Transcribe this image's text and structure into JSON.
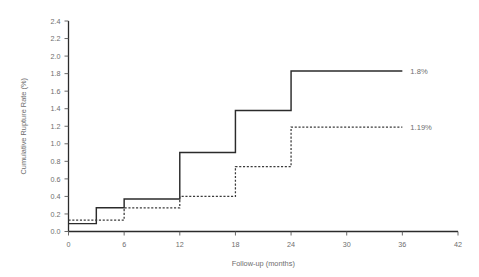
{
  "chart_data": {
    "type": "line",
    "title": "",
    "subtitle": "",
    "xlabel": "Follow-up (months)",
    "ylabel": "Cumulative Rupture Rate (%)",
    "xlim": [
      0,
      42
    ],
    "ylim": [
      0.0,
      2.4
    ],
    "xticks": [
      0,
      6,
      12,
      18,
      24,
      30,
      36,
      42
    ],
    "xtick_labels": [
      "0",
      "6",
      "12",
      "18",
      "24",
      "30",
      "36",
      "42"
    ],
    "yticks": [
      0.0,
      0.2,
      0.4,
      0.6,
      0.8,
      1.0,
      1.2,
      1.4,
      1.6,
      1.8,
      2.0,
      2.2,
      2.4
    ],
    "ytick_labels": [
      "0.0",
      "0.2",
      "0.4",
      "0.6",
      "0.8",
      "1.0",
      "1.2",
      "1.4",
      "1.6",
      "1.8",
      "2.0",
      "2.2",
      "2.4"
    ],
    "grid": false,
    "legend_position": "inline-right-end-labels",
    "step_mode": "post",
    "series": [
      {
        "name": "solid-series",
        "style": "solid",
        "color": "#2b2b2b",
        "end_label": "1.8%",
        "x": [
          0,
          3,
          6,
          12,
          18,
          24,
          36
        ],
        "values": [
          0.09,
          0.27,
          0.37,
          0.9,
          1.38,
          1.83,
          1.83
        ]
      },
      {
        "name": "dashed-series",
        "style": "dashed",
        "color": "#3b3b3b",
        "end_label": "1.19%",
        "x": [
          0,
          6,
          12,
          18,
          24,
          36
        ],
        "values": [
          0.13,
          0.27,
          0.4,
          0.74,
          1.19,
          1.19
        ]
      }
    ],
    "annotations": [
      {
        "text": "1.8%",
        "x": 36,
        "y": 1.83,
        "anchor": "left-of-axis-end"
      },
      {
        "text": "1.19%",
        "x": 36,
        "y": 1.19,
        "anchor": "left-of-axis-end"
      }
    ]
  }
}
